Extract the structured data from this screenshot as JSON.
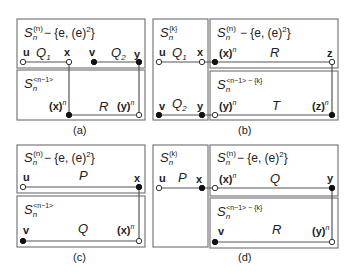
{
  "panels": {
    "a": {
      "caption": "(a)",
      "top_label": {
        "base": "S",
        "sub": "n",
        "sup": "(n)",
        "rest": "− {e, (e)",
        "sq": "2",
        "close": "}"
      },
      "bottom_label": {
        "base": "S",
        "sub": "n",
        "sup": "<n−1>"
      },
      "nodes": {
        "u": "u",
        "x": "x",
        "v": "v",
        "y": "y",
        "xn": "(x)",
        "yn": "(y)",
        "n": "n"
      },
      "paths": {
        "Q1": "Q",
        "Q1_sub": "1",
        "Q2": "Q",
        "Q2_sub": "2",
        "R": "R"
      }
    },
    "b": {
      "caption": "(b)",
      "left_label": {
        "base": "S",
        "sub": "n",
        "sup": "{k}"
      },
      "right_top_label": {
        "base": "S",
        "sub": "n",
        "sup": "(n)",
        "rest": "− {e, (e)",
        "sq": "2",
        "close": "}"
      },
      "right_bottom_label": {
        "base": "S",
        "sub": "n",
        "sup": "<n−1> − {k}"
      },
      "nodes": {
        "u": "u",
        "x": "x",
        "v": "v",
        "y": "y",
        "z": "z",
        "xn": "(x)",
        "yn": "(y)",
        "zn": "(z)",
        "n": "n"
      },
      "paths": {
        "Q1": "Q",
        "Q1_sub": "1",
        "Q2": "Q",
        "Q2_sub": "2",
        "R": "R",
        "T": "T"
      }
    },
    "c": {
      "caption": "(c)",
      "top_label": {
        "base": "S",
        "sub": "n",
        "sup": "(n)",
        "rest": "− {e, (e)",
        "sq": "2",
        "close": "}"
      },
      "bottom_label": {
        "base": "S",
        "sub": "n",
        "sup": "<n−1>"
      },
      "nodes": {
        "u": "u",
        "x": "x",
        "v": "v",
        "xn": "(x)",
        "n": "n"
      },
      "paths": {
        "P": "P",
        "Q": "Q"
      }
    },
    "d": {
      "caption": "(d)",
      "left_label": {
        "base": "S",
        "sub": "n",
        "sup": "(k)"
      },
      "right_top_label": {
        "base": "S",
        "sub": "n",
        "sup": "(n)",
        "rest": "− {e, (e)",
        "sq": "2",
        "close": "}"
      },
      "right_bottom_label": {
        "base": "S",
        "sub": "n",
        "sup": "<n−1> − {k}"
      },
      "nodes": {
        "u": "u",
        "x": "x",
        "v": "v",
        "y": "y",
        "xn": "(x)",
        "yn": "(y)",
        "n": "n"
      },
      "paths": {
        "P": "P",
        "Q": "Q",
        "R": "R"
      }
    }
  }
}
